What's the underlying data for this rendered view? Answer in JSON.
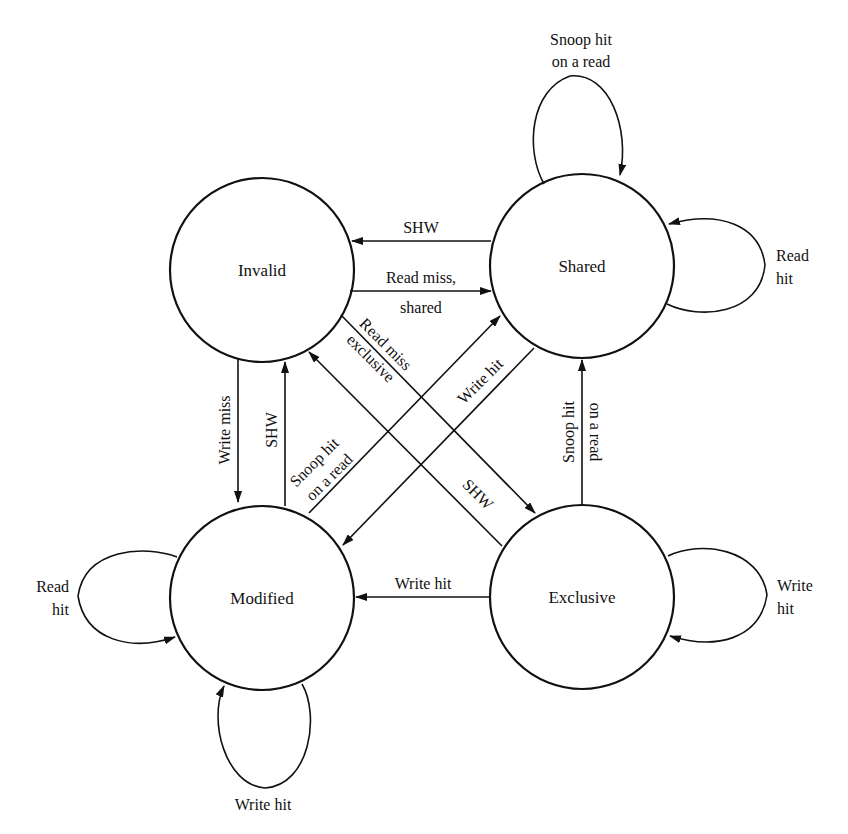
{
  "diagram": {
    "colors": {
      "background": "#ffffff",
      "stroke": "#111111",
      "text": "#111111"
    },
    "states": {
      "invalid": {
        "label": "Invalid"
      },
      "shared": {
        "label": "Shared"
      },
      "modified": {
        "label": "Modified"
      },
      "exclusive": {
        "label": "Exclusive"
      }
    },
    "transitions": {
      "shared_to_invalid": {
        "from": "Shared",
        "to": "Invalid",
        "label": "SHW"
      },
      "invalid_to_shared": {
        "from": "Invalid",
        "to": "Shared",
        "label_line1": "Read miss,",
        "label_line2": "shared"
      },
      "invalid_to_modified": {
        "from": "Invalid",
        "to": "Modified",
        "label": "Write miss"
      },
      "modified_to_invalid": {
        "from": "Modified",
        "to": "Invalid",
        "label": "SHW"
      },
      "exclusive_to_shared": {
        "from": "Exclusive",
        "to": "Shared",
        "label_line1": "Snoop hit",
        "label_line2": "on a read"
      },
      "exclusive_to_modified": {
        "from": "Exclusive",
        "to": "Modified",
        "label": "Write hit"
      },
      "invalid_to_exclusive": {
        "from": "Invalid",
        "to": "Exclusive",
        "label_line1": "Read miss",
        "label_line2": "exclusive"
      },
      "exclusive_to_invalid": {
        "from": "Exclusive",
        "to": "Invalid",
        "label": "SHW"
      },
      "modified_to_shared": {
        "from": "Modified",
        "to": "Shared",
        "label_line1": "Snoop hit",
        "label_line2": "on a read"
      },
      "shared_to_modified": {
        "from": "Shared",
        "to": "Modified",
        "label": "Write hit"
      }
    },
    "self_loops": {
      "shared_top": {
        "state": "Shared",
        "label_line1": "Snoop hit",
        "label_line2": "on a read"
      },
      "shared_right": {
        "state": "Shared",
        "label_line1": "Read",
        "label_line2": "hit"
      },
      "modified_left": {
        "state": "Modified",
        "label_line1": "Read",
        "label_line2": "hit"
      },
      "modified_bottom": {
        "state": "Modified",
        "label": "Write hit"
      },
      "exclusive_right": {
        "state": "Exclusive",
        "label_line1": "Write",
        "label_line2": "hit"
      }
    }
  }
}
